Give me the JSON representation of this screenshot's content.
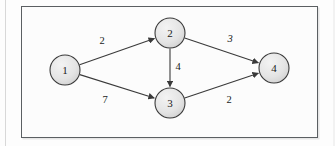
{
  "figure": {
    "kind": "directed-weighted-graph-diagram",
    "frame": {
      "x": 21,
      "y": 6,
      "width": 297,
      "height": 132,
      "border_color": "#5b5f62",
      "background_color": "#fcfcfc"
    },
    "page_background": "#fdfdfd"
  },
  "style": {
    "node_fill": "#e2e2e2",
    "node_fill_highlight": "#f2f2f2",
    "node_stroke": "#3a3a3a",
    "edge_color": "#3a3a3a",
    "label_color": "#1a1a1a",
    "node_radius": 15
  },
  "graph": {
    "nodes": [
      {
        "id": "1",
        "label": "1",
        "cx": 65,
        "cy": 70
      },
      {
        "id": "2",
        "label": "2",
        "cx": 170,
        "cy": 33
      },
      {
        "id": "3",
        "label": "3",
        "cx": 170,
        "cy": 103
      },
      {
        "id": "4",
        "label": "4",
        "cx": 274,
        "cy": 68
      }
    ],
    "edges": [
      {
        "id": "e1",
        "from": "1",
        "to": "2",
        "weight": "2",
        "weight_x": 102,
        "weight_y": 41,
        "italic": false,
        "directed": true
      },
      {
        "id": "e2",
        "from": "1",
        "to": "3",
        "weight": "7",
        "weight_x": 105,
        "weight_y": 100,
        "italic": false,
        "directed": true
      },
      {
        "id": "e3",
        "from": "2",
        "to": "3",
        "weight": "4",
        "weight_x": 178,
        "weight_y": 67,
        "italic": false,
        "directed": true
      },
      {
        "id": "e4",
        "from": "2",
        "to": "4",
        "weight": "3",
        "weight_x": 230,
        "weight_y": 39,
        "italic": true,
        "directed": true
      },
      {
        "id": "e5",
        "from": "3",
        "to": "4",
        "weight": "2",
        "weight_x": 229,
        "weight_y": 100,
        "italic": false,
        "directed": true
      }
    ]
  }
}
